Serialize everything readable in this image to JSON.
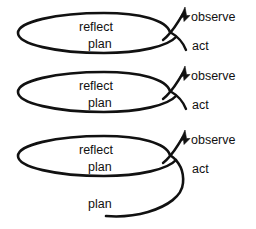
{
  "figure": {
    "kind": "spiral-iteration-diagram",
    "background_color": "#ffffff",
    "ink_color": "#111111",
    "loop_count": 3
  },
  "loops": [
    {
      "index": 1,
      "inner_labels": {
        "reflect": "reflect",
        "plan": "plan"
      },
      "outer_labels": {
        "observe": "observe",
        "act": "act"
      }
    },
    {
      "index": 2,
      "inner_labels": {
        "reflect": "reflect",
        "plan": "plan"
      },
      "outer_labels": {
        "observe": "observe",
        "act": "act"
      }
    },
    {
      "index": 3,
      "inner_labels": {
        "reflect": "reflect",
        "plan": "plan"
      },
      "outer_labels": {
        "observe": "observe",
        "act": "act"
      }
    }
  ],
  "tail": {
    "label": "plan"
  },
  "icons": {
    "arrow_head": "arrowhead-up-right-icon"
  }
}
